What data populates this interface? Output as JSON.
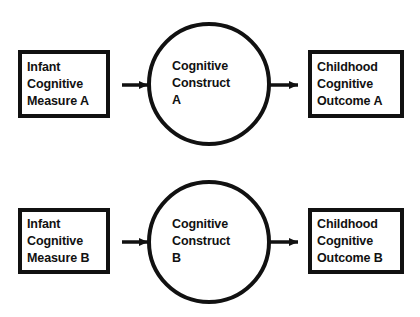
{
  "diagram": {
    "type": "path-model",
    "rows": [
      {
        "id": "row-a",
        "left_node": {
          "label": "Infant\nCognitive\nMeasure A",
          "shape": "rectangle"
        },
        "center_node": {
          "label": "Cognitive\nConstruct\nA",
          "shape": "circle"
        },
        "right_node": {
          "label": "Childhood\nCognitive\nOutcome A",
          "shape": "rectangle"
        },
        "left_edge": {
          "direction": "left",
          "style": "solid",
          "arrowhead": "filled-triangle"
        },
        "right_edge": {
          "direction": "right",
          "style": "solid",
          "arrowhead": "filled-triangle"
        }
      },
      {
        "id": "row-b",
        "left_node": {
          "label": "Infant\nCognitive\nMeasure B",
          "shape": "rectangle"
        },
        "center_node": {
          "label": "Cognitive\nConstruct\nB",
          "shape": "circle"
        },
        "right_node": {
          "label": "Childhood\nCognitive\nOutcome B",
          "shape": "rectangle"
        },
        "left_edge": {
          "direction": "left",
          "style": "solid",
          "arrowhead": "filled-triangle"
        },
        "right_edge": {
          "direction": "right",
          "style": "solid",
          "arrowhead": "filled-triangle"
        }
      }
    ],
    "colors": {
      "stroke": "#111111",
      "fill": "#ffffff",
      "background": "#ffffff",
      "text": "#111111"
    }
  }
}
